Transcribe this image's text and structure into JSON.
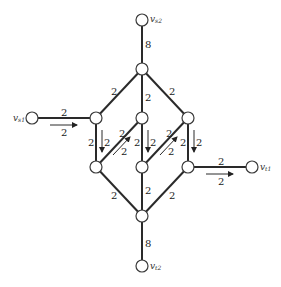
{
  "diagram": {
    "type": "flow-network",
    "nodes": [
      {
        "id": "vs2",
        "label": "v",
        "sub": "s2",
        "x": 142,
        "y": 20
      },
      {
        "id": "top",
        "label": "",
        "x": 142,
        "y": 69
      },
      {
        "id": "lm",
        "label": "",
        "x": 96,
        "y": 118
      },
      {
        "id": "cm",
        "label": "",
        "x": 142,
        "y": 118
      },
      {
        "id": "rm",
        "label": "",
        "x": 188,
        "y": 118
      },
      {
        "id": "ll",
        "label": "",
        "x": 96,
        "y": 167
      },
      {
        "id": "cl",
        "label": "",
        "x": 142,
        "y": 167
      },
      {
        "id": "rl",
        "label": "",
        "x": 188,
        "y": 167
      },
      {
        "id": "bot",
        "label": "",
        "x": 142,
        "y": 216
      },
      {
        "id": "vt2",
        "label": "v",
        "sub": "t2",
        "x": 142,
        "y": 266
      },
      {
        "id": "vs1",
        "label": "v",
        "sub": "s1",
        "x": 32,
        "y": 118
      },
      {
        "id": "vt1",
        "label": "v",
        "sub": "t1",
        "x": 252,
        "y": 167
      }
    ],
    "edges": [
      {
        "from": "vs2",
        "to": "top",
        "capacity": "8"
      },
      {
        "from": "top",
        "to": "lm",
        "capacity": "2"
      },
      {
        "from": "top",
        "to": "cm",
        "capacity": "2"
      },
      {
        "from": "top",
        "to": "rm",
        "capacity": "2"
      },
      {
        "from": "vs1",
        "to": "lm",
        "capacity": "2",
        "flow": "2"
      },
      {
        "from": "lm",
        "to": "ll",
        "capacity": "2",
        "flow": "2"
      },
      {
        "from": "cm",
        "to": "cl",
        "capacity": "2",
        "flow": "2"
      },
      {
        "from": "rm",
        "to": "rl",
        "capacity": "2",
        "flow": "2"
      },
      {
        "from": "ll",
        "to": "cm",
        "capacity": "2",
        "flow": "2"
      },
      {
        "from": "cl",
        "to": "rm",
        "capacity": "2",
        "flow": "2"
      },
      {
        "from": "rl",
        "to": "vt1",
        "capacity": "2",
        "flow": "2"
      },
      {
        "from": "ll",
        "to": "bot",
        "capacity": "2"
      },
      {
        "from": "cl",
        "to": "bot",
        "capacity": "2"
      },
      {
        "from": "rl",
        "to": "bot",
        "capacity": "2"
      },
      {
        "from": "bot",
        "to": "vt2",
        "capacity": "8"
      }
    ],
    "labels": {
      "vs2_v": "v",
      "vs2_sub": "s2",
      "vt2_v": "v",
      "vt2_sub": "t2",
      "vs1_v": "v",
      "vs1_sub": "s1",
      "vt1_v": "v",
      "vt1_sub": "t1",
      "cap_top": "8",
      "cap_bottom": "8",
      "cap_two": "2",
      "flow_two": "2"
    }
  }
}
